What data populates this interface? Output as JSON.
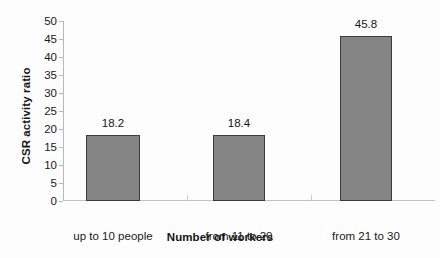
{
  "chart_data": {
    "type": "bar",
    "title": "",
    "xlabel": "Number of workers",
    "ylabel": "CSR activity ratio",
    "categories": [
      "up to 10 people",
      "from 11 to 20",
      "from 21 to 30"
    ],
    "values": [
      18.2,
      18.4,
      45.8
    ],
    "value_labels": [
      "18.2",
      "18.4",
      "45.8"
    ],
    "ylim": [
      0,
      50
    ],
    "ytick_step": 5,
    "ytick_labels": [
      "50",
      "45",
      "40",
      "35",
      "30",
      "25",
      "20",
      "15",
      "10",
      "5",
      "0"
    ],
    "grid": false,
    "legend": null,
    "bar_color": "#858585",
    "bar_border_color": "#3c3c3c",
    "axis_color": "#b9b9b9",
    "text_color": "#151515",
    "background_color": "#fdfdfd"
  }
}
